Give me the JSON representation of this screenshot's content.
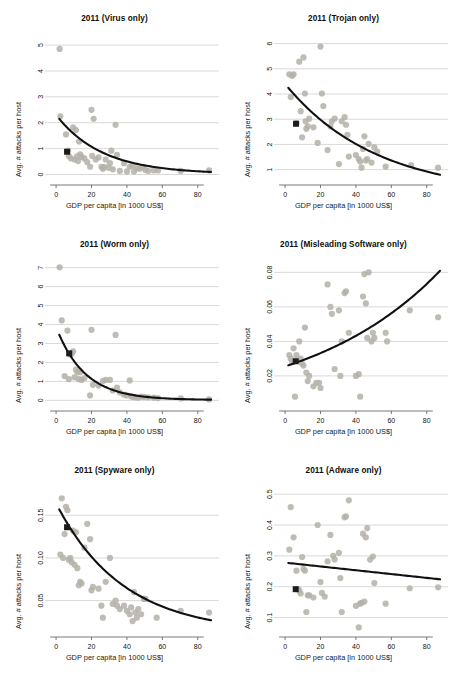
{
  "figure": {
    "name": "malware-attacks-vs-gdp-panels",
    "panel_count": 6,
    "colors": {
      "point": "#b4b0a8",
      "point_stroke": "#a9a59d",
      "fit_line": "#111111",
      "highlight_marker": "#1c1c1c",
      "gridline": "#c8c8c8",
      "axis": "#555555",
      "background": "#ffffff",
      "text": "#111111"
    },
    "shared": {
      "xlabel": "GDP per capita [in 1000 US$]",
      "ylabel": "Avg. # attacks per host",
      "xticks": [
        "0",
        "20",
        "40",
        "60",
        "80"
      ],
      "xlim": [
        -4,
        92
      ]
    }
  },
  "chart_data": [
    {
      "type": "scatter",
      "panel": 1,
      "title": "2011 (Virus only)",
      "xlabel": "GDP per capita [in 1000 US$]",
      "ylabel": "Avg. # attacks per host",
      "xlim": [
        -4,
        92
      ],
      "ylim": [
        -0.25,
        5.35
      ],
      "xticks": [
        0,
        20,
        40,
        60,
        80
      ],
      "yticks": [
        0,
        1,
        2,
        3,
        4,
        5
      ],
      "ytick_labels": [
        "0",
        "1",
        "2",
        "3",
        "4",
        "5"
      ],
      "grid": true,
      "legend": "none",
      "x": [
        2.0,
        2.4,
        5.6,
        6.8,
        7.2,
        8.4,
        9.6,
        10.4,
        11.2,
        11.8,
        12.4,
        13.0,
        13.6,
        14.4,
        16.0,
        17.6,
        19.2,
        20.0,
        20.4,
        21.2,
        22.4,
        24.0,
        25.6,
        26.4,
        27.2,
        28.0,
        29.6,
        30.4,
        31.2,
        32.0,
        33.6,
        34.4,
        36.0,
        38.4,
        40.0,
        41.6,
        43.2,
        44.0,
        45.6,
        47.2,
        48.8,
        50.4,
        52.0,
        55.2,
        57.6,
        70.4,
        86.4
      ],
      "y": [
        4.85,
        2.25,
        1.55,
        0.92,
        0.72,
        0.62,
        1.82,
        0.58,
        1.72,
        0.7,
        0.52,
        1.28,
        0.78,
        0.68,
        0.62,
        0.48,
        0.3,
        2.5,
        0.72,
        2.15,
        0.58,
        0.66,
        0.3,
        0.22,
        0.3,
        0.58,
        0.26,
        0.44,
        0.92,
        0.2,
        1.92,
        0.76,
        0.14,
        0.44,
        0.12,
        0.3,
        0.34,
        0.12,
        0.24,
        0.22,
        0.28,
        0.18,
        0.14,
        0.16,
        0.16,
        0.14,
        0.16
      ],
      "highlight_point": {
        "x": 6.2,
        "y": 0.88,
        "label": "reference-country"
      },
      "fit": {
        "form": "exponential-decay",
        "a": 2.28,
        "b": 0.0385,
        "c": 0.02,
        "x_start": 1.8,
        "x_end": 87.5
      }
    },
    {
      "type": "scatter",
      "panel": 2,
      "title": "2011 (Trojan only)",
      "xlabel": "GDP per capita [in 1000 US$]",
      "ylabel": "Avg. # attacks per host",
      "xlim": [
        -4,
        92
      ],
      "ylim": [
        0.55,
        6.3
      ],
      "xticks": [
        0,
        20,
        40,
        60,
        80
      ],
      "yticks": [
        1,
        2,
        3,
        4,
        5,
        6
      ],
      "ytick_labels": [
        "1",
        "2",
        "3",
        "4",
        "5",
        "6"
      ],
      "grid": true,
      "legend": "none",
      "x": [
        2.4,
        3.2,
        4.0,
        4.8,
        6.4,
        8.0,
        8.8,
        9.6,
        10.4,
        11.2,
        11.6,
        12.0,
        12.8,
        13.6,
        16.0,
        18.4,
        20.0,
        20.8,
        21.6,
        24.0,
        25.6,
        26.4,
        28.0,
        30.4,
        32.0,
        33.6,
        34.4,
        35.2,
        36.0,
        40.0,
        41.6,
        42.4,
        43.2,
        44.0,
        44.8,
        45.6,
        46.4,
        47.2,
        48.8,
        50.4,
        52.0,
        56.8,
        71.2,
        86.4
      ],
      "y": [
        4.78,
        3.88,
        4.72,
        4.78,
        2.85,
        5.28,
        3.32,
        2.28,
        5.45,
        4.02,
        2.92,
        2.62,
        2.72,
        3.02,
        2.68,
        2.06,
        5.88,
        4.02,
        3.52,
        1.78,
        2.72,
        2.92,
        3.02,
        1.22,
        2.92,
        3.08,
        2.78,
        2.38,
        1.52,
        1.58,
        1.42,
        1.32,
        1.08,
        1.82,
        2.32,
        1.36,
        1.42,
        2.02,
        1.28,
        1.88,
        1.72,
        1.12,
        1.18,
        1.08
      ],
      "highlight_point": {
        "x": 6.2,
        "y": 2.82,
        "label": "reference-country"
      },
      "fit": {
        "form": "exponential-decay",
        "a": 4.4,
        "b": 0.0195,
        "c": 0.0,
        "x_start": 1.8,
        "x_end": 87.5
      }
    },
    {
      "type": "scatter",
      "panel": 3,
      "title": "2011 (Worm only)",
      "xlabel": "GDP per capita [in 1000 US$]",
      "ylabel": "Avg. # attacks per host",
      "xlim": [
        -4,
        92
      ],
      "ylim": [
        -0.35,
        7.3
      ],
      "xticks": [
        0,
        20,
        40,
        60,
        80
      ],
      "yticks": [
        0,
        1,
        2,
        3,
        4,
        5,
        6,
        7
      ],
      "ytick_labels": [
        "0",
        "1",
        "2",
        "3",
        "4",
        "5",
        "6",
        "7"
      ],
      "grid": true,
      "legend": "none",
      "x": [
        2.0,
        3.2,
        4.8,
        6.4,
        7.2,
        8.0,
        8.8,
        9.6,
        10.4,
        11.2,
        12.0,
        12.8,
        13.6,
        14.4,
        16.0,
        19.2,
        20.0,
        20.8,
        24.0,
        26.4,
        28.0,
        30.4,
        32.0,
        33.6,
        34.4,
        36.0,
        38.4,
        40.0,
        41.6,
        42.4,
        43.2,
        44.8,
        46.4,
        48.0,
        49.6,
        52.0,
        55.2,
        57.6,
        70.4,
        86.4
      ],
      "y": [
        7.02,
        4.22,
        1.28,
        3.68,
        1.12,
        2.42,
        2.46,
        2.58,
        1.22,
        1.62,
        1.48,
        1.12,
        1.48,
        1.08,
        1.18,
        0.26,
        3.72,
        0.82,
        0.78,
        1.02,
        1.08,
        1.08,
        0.52,
        3.45,
        0.68,
        0.42,
        0.3,
        0.26,
        1.05,
        0.22,
        0.18,
        0.16,
        0.14,
        0.2,
        0.18,
        0.16,
        0.14,
        0.12,
        0.1,
        0.05
      ],
      "highlight_point": {
        "x": 7.4,
        "y": 2.48,
        "label": "reference-country"
      },
      "fit": {
        "form": "exponential-decay",
        "a": 3.85,
        "b": 0.062,
        "c": 0.02,
        "x_start": 1.8,
        "x_end": 87.5
      }
    },
    {
      "type": "scatter",
      "panel": 4,
      "title": "2011 (Misleading Software only)",
      "xlabel": "GDP per capita [in 1000 US$]",
      "ylabel": "Avg. # attacks per host",
      "xlim": [
        -4,
        92
      ],
      "ylim": [
        0.002,
        0.086
      ],
      "xticks": [
        0,
        20,
        40,
        60,
        80
      ],
      "yticks": [
        0.02,
        0.04,
        0.06,
        0.08
      ],
      "ytick_labels": [
        "0.02",
        "0.04",
        "0.06",
        "0.08"
      ],
      "grid": true,
      "legend": "none",
      "x": [
        2.4,
        3.2,
        4.0,
        4.8,
        5.6,
        6.4,
        8.0,
        8.8,
        9.6,
        10.4,
        11.2,
        12.0,
        12.8,
        13.6,
        16.0,
        17.6,
        19.2,
        20.0,
        24.0,
        25.6,
        26.4,
        28.0,
        30.4,
        31.2,
        32.0,
        33.6,
        34.4,
        36.0,
        40.0,
        41.6,
        42.4,
        44.0,
        44.8,
        45.6,
        46.4,
        47.2,
        48.8,
        49.6,
        50.4,
        56.8,
        57.6,
        70.4,
        86.4
      ],
      "y": [
        0.032,
        0.03,
        0.028,
        0.036,
        0.008,
        0.032,
        0.04,
        0.03,
        0.027,
        0.026,
        0.048,
        0.022,
        0.017,
        0.02,
        0.014,
        0.016,
        0.016,
        0.013,
        0.073,
        0.06,
        0.056,
        0.024,
        0.058,
        0.02,
        0.04,
        0.068,
        0.069,
        0.045,
        0.02,
        0.021,
        0.008,
        0.066,
        0.079,
        0.062,
        0.042,
        0.08,
        0.04,
        0.045,
        0.042,
        0.045,
        0.04,
        0.058,
        0.054
      ],
      "highlight_point": {
        "x": 6.0,
        "y": 0.0285,
        "label": "reference-country"
      },
      "fit": {
        "form": "exponential-growth",
        "a": 0.0255,
        "b": 0.0132,
        "x_start": 1.8,
        "x_end": 87.5
      }
    },
    {
      "type": "scatter",
      "panel": 5,
      "title": "2011 (Spyware only)",
      "xlabel": "GDP per capita [in 1000 US$]",
      "ylabel": "Avg. # attacks per host",
      "xlim": [
        -4,
        92
      ],
      "ylim": [
        0.012,
        0.182
      ],
      "xticks": [
        0,
        20,
        40,
        60,
        80
      ],
      "yticks": [
        0.05,
        0.1,
        0.15
      ],
      "ytick_labels": [
        "0.05",
        "0.10",
        "0.15"
      ],
      "grid": true,
      "legend": "none",
      "x": [
        2.4,
        3.2,
        4.0,
        4.8,
        5.6,
        6.4,
        7.2,
        8.0,
        8.8,
        9.6,
        10.4,
        11.2,
        12.0,
        12.8,
        13.6,
        14.4,
        16.0,
        17.6,
        19.2,
        20.0,
        20.8,
        24.0,
        25.6,
        26.4,
        28.0,
        30.4,
        32.0,
        33.6,
        34.4,
        36.0,
        38.4,
        40.0,
        41.6,
        42.4,
        43.2,
        44.0,
        44.8,
        45.6,
        46.4,
        48.0,
        49.6,
        50.4,
        56.8,
        70.4,
        86.4
      ],
      "y": [
        0.104,
        0.17,
        0.1,
        0.128,
        0.16,
        0.156,
        0.098,
        0.1,
        0.095,
        0.132,
        0.092,
        0.13,
        0.088,
        0.068,
        0.072,
        0.07,
        0.112,
        0.14,
        0.122,
        0.062,
        0.066,
        0.064,
        0.044,
        0.03,
        0.072,
        0.1,
        0.046,
        0.05,
        0.044,
        0.04,
        0.044,
        0.038,
        0.034,
        0.042,
        0.026,
        0.06,
        0.036,
        0.03,
        0.04,
        0.034,
        0.052,
        0.052,
        0.03,
        0.038,
        0.036
      ],
      "highlight_point": {
        "x": 6.2,
        "y": 0.136,
        "label": "reference-country"
      },
      "fit": {
        "form": "exponential-decay",
        "a": 0.152,
        "b": 0.0265,
        "c": 0.012,
        "x_start": 1.8,
        "x_end": 87.5
      }
    },
    {
      "type": "scatter",
      "panel": 6,
      "title": "2011 (Adware only)",
      "xlabel": "GDP per capita [in 1000 US$]",
      "ylabel": "Avg. # attacks per host",
      "xlim": [
        -4,
        92
      ],
      "ylim": [
        0.05,
        0.52
      ],
      "xticks": [
        0,
        20,
        40,
        60,
        80
      ],
      "yticks": [
        0.1,
        0.2,
        0.3,
        0.4,
        0.5
      ],
      "ytick_labels": [
        "0.1",
        "0.2",
        "0.3",
        "0.4",
        "0.5"
      ],
      "grid": true,
      "legend": "none",
      "x": [
        2.4,
        3.2,
        4.8,
        6.4,
        7.2,
        8.0,
        8.8,
        9.6,
        10.4,
        11.2,
        12.0,
        12.8,
        13.6,
        16.0,
        18.4,
        20.0,
        20.8,
        22.4,
        24.0,
        25.6,
        27.2,
        28.0,
        30.4,
        31.2,
        32.0,
        33.6,
        34.4,
        36.0,
        40.0,
        41.6,
        42.4,
        43.2,
        44.0,
        44.8,
        45.6,
        46.4,
        48.0,
        49.6,
        50.4,
        56.8,
        70.4,
        86.4
      ],
      "y": [
        0.32,
        0.458,
        0.36,
        0.252,
        0.192,
        0.188,
        0.178,
        0.296,
        0.258,
        0.252,
        0.118,
        0.172,
        0.172,
        0.165,
        0.4,
        0.215,
        0.18,
        0.168,
        0.282,
        0.368,
        0.3,
        0.288,
        0.31,
        0.228,
        0.118,
        0.425,
        0.428,
        0.48,
        0.138,
        0.068,
        0.145,
        0.148,
        0.372,
        0.152,
        0.36,
        0.39,
        0.288,
        0.298,
        0.212,
        0.145,
        0.195,
        0.198
      ],
      "highlight_point": {
        "x": 6.0,
        "y": 0.192,
        "label": "reference-country"
      },
      "fit": {
        "form": "linear",
        "y_start": 0.277,
        "y_end": 0.224,
        "x_start": 1.8,
        "x_end": 87.5
      }
    }
  ]
}
